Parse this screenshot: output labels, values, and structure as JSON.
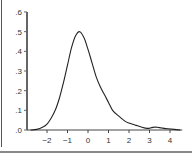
{
  "chart_data": {
    "type": "line",
    "title": "",
    "xlabel": "",
    "ylabel": "",
    "xlim": [
      -2.8,
      4.6
    ],
    "ylim": [
      0,
      0.6
    ],
    "grid": false,
    "legend": null,
    "x_ticks": [
      -2,
      -1,
      0,
      1,
      2,
      3,
      4
    ],
    "x_tick_labels": [
      "−2",
      "−1",
      "0",
      "1",
      "2",
      "3",
      "4"
    ],
    "y_ticks": [
      0,
      0.1,
      0.2,
      0.3,
      0.4,
      0.5,
      0.6
    ],
    "y_tick_labels": [
      ".0",
      ".1",
      ".2",
      ".3",
      ".4",
      ".5",
      ".6"
    ],
    "series": [
      {
        "name": "density",
        "x": [
          -2.8,
          -2.5,
          -2.2,
          -2.0,
          -1.8,
          -1.6,
          -1.4,
          -1.2,
          -1.0,
          -0.8,
          -0.6,
          -0.4,
          -0.2,
          0.0,
          0.2,
          0.4,
          0.6,
          0.8,
          1.0,
          1.2,
          1.5,
          1.8,
          2.0,
          2.3,
          2.6,
          2.9,
          3.1,
          3.3,
          3.6,
          3.9,
          4.2,
          4.5
        ],
        "y": [
          0.0,
          0.003,
          0.015,
          0.03,
          0.06,
          0.1,
          0.16,
          0.24,
          0.33,
          0.42,
          0.48,
          0.5,
          0.47,
          0.41,
          0.34,
          0.27,
          0.22,
          0.18,
          0.14,
          0.1,
          0.07,
          0.045,
          0.035,
          0.025,
          0.015,
          0.008,
          0.012,
          0.015,
          0.01,
          0.006,
          0.003,
          0.0
        ]
      }
    ]
  }
}
